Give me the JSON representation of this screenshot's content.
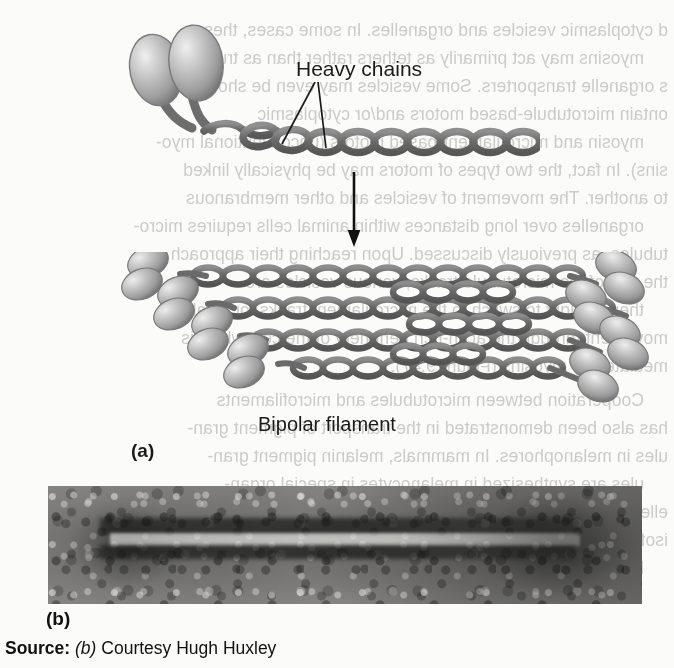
{
  "figure": {
    "panel_a": {
      "label": "(a)",
      "annotations": {
        "heavy_chains": "Heavy chains",
        "bipolar_filament": "Bipolar filament"
      },
      "arrow": {
        "direction": "down",
        "name": "assembly-arrow"
      },
      "monomer": {
        "head_count": 2,
        "tail_coil_units": 11,
        "description": "Single myosin II molecule: two globular heads and a coiled-coil tail of two heavy chains"
      },
      "filament": {
        "description": "Bipolar thick filament assembled from many myosin II molecules, heads projecting at both ends, bare zone in the middle",
        "left_head_pairs": 5,
        "right_head_pairs": 5,
        "strand_count": 4
      }
    },
    "panel_b": {
      "label": "(b)",
      "description": "Electron micrograph of a bipolar myosin thick filament, negative stain"
    },
    "source": {
      "key": "Source:",
      "panel_ref": "(b)",
      "credit": "Courtesy Hugh Huxley"
    }
  },
  "colors": {
    "page_background": "#fbfbfa",
    "ink": "#1a1a1a",
    "protein_gray_dark": "#6e6e6e",
    "protein_gray_mid": "#9a9a9a",
    "protein_gray_light": "#d8d8d8",
    "bleed_text": "#c9c9c6",
    "micrograph_base": "#8e8d8a"
  },
  "bleed_text": {
    "note": "Faint mirrored text showing through from the reverse side of the printed page",
    "lines": [
      {
        "text": "d cytoplasmic vesicles and organelles. In some cases, these",
        "top": 20
      },
      {
        "text": "myosins may act primarily as tethers rather than as true",
        "top": 48
      },
      {
        "text": "s organelle transporters. Some vesicles may even be shown to",
        "top": 76
      },
      {
        "text": "ontain microtubule-based motors and/or cytoplasmic",
        "top": 104
      },
      {
        "text": "myosin and microfilament-based motors (unconventional myo-",
        "top": 132
      },
      {
        "text": "sins). In fact, the two types of motors may be physically linked",
        "top": 160
      },
      {
        "text": "to another. The movement of vesicles and other membranous",
        "top": 188
      },
      {
        "text": "organelles over long distances within animal cells requires micro-",
        "top": 216
      },
      {
        "text": "tubules, as previously discussed. Upon reaching their approach",
        "top": 244
      },
      {
        "text": "the end of the microtubule tracks, various vesicles are",
        "top": 272
      },
      {
        "text": "then thought to switch to the microfilament tracks for local",
        "top": 300
      },
      {
        "text": "movement through the actin-rich periphery of the cell, which is",
        "top": 328
      },
      {
        "text": "mediated by myosins (Figure 9.47).",
        "top": 356
      },
      {
        "text": "Cooperation between microtubules and microfilaments",
        "top": 390
      },
      {
        "text": "has also been demonstrated in the transport of pigment gran-",
        "top": 418
      },
      {
        "text": "ules in melanophores. In mammals, melanin pigment gran-",
        "top": 446
      },
      {
        "text": "ules are synthesized in melanocytes in special organ-",
        "top": 474
      },
      {
        "text": "elles called melanosomes and their transferred to",
        "top": 502
      },
      {
        "text": "isoforms called Va. Melanosomes are then transferred to",
        "top": 530
      },
      {
        "text": "keratinocytes where they become incorporated into hair",
        "top": 558
      }
    ]
  }
}
